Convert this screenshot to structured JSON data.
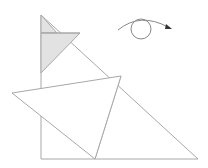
{
  "diagram": {
    "title": "",
    "stroke_color": "#a8a8a8",
    "fill_shaded": "#e2e2e2",
    "fill_white": "#ffffff",
    "rotation_icon": "rotate-clockwise-arrow-icon",
    "shapes": {
      "big_right_triangle": {
        "points": [
          [
            41,
            15
          ],
          [
            41,
            159
          ],
          [
            198,
            159
          ]
        ]
      },
      "shaded_top_triangle": {
        "points": [
          [
            41,
            15
          ],
          [
            41,
            33
          ],
          [
            57,
            33
          ]
        ]
      },
      "shaded_quad": {
        "points": [
          [
            41,
            33
          ],
          [
            80,
            33
          ],
          [
            41,
            73
          ]
        ]
      },
      "folded_flap": {
        "points": [
          [
            12,
            93
          ],
          [
            121,
            76
          ],
          [
            95,
            159
          ]
        ]
      },
      "right_triangle_section": {
        "points": [
          [
            121,
            76
          ],
          [
            198,
            159
          ],
          [
            95,
            159
          ]
        ]
      }
    },
    "rotation_symbol": {
      "circle": {
        "cx": 141,
        "cy": 29,
        "r": 10
      },
      "arrow_arc": {
        "start": [
          118,
          30
        ],
        "end": [
          171,
          28
        ]
      }
    }
  }
}
